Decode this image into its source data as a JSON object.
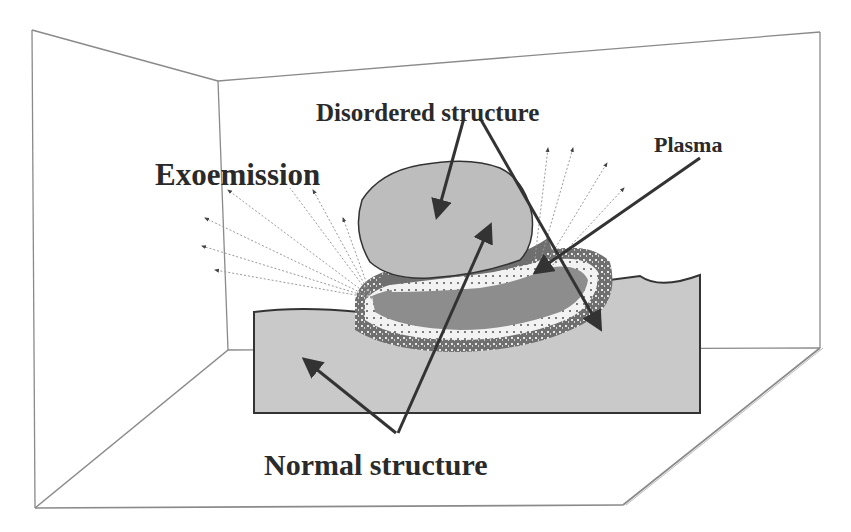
{
  "diagram": {
    "labels": {
      "disordered": "Disordered structure",
      "plasma": "Plasma",
      "exoemission": "Exoemission",
      "normal": "Normal structure"
    },
    "colors": {
      "background": "#ffffff",
      "frame_line": "#8a8a8a",
      "block_fill": "#c9c9c9",
      "disordered_fill": "#bdbdbd",
      "dark_band": "#6f6f6f",
      "mid_band": "#8d8d8d",
      "light_band": "#f2f2f2",
      "arrow": "#333333",
      "emission_line": "#9a9a9a"
    },
    "elements": [
      "room-frame",
      "substrate-block",
      "disordered-cap",
      "layered-bands",
      "exoemission-rays",
      "plasma-arrow",
      "disordered-arrows",
      "normal-arrows"
    ]
  }
}
